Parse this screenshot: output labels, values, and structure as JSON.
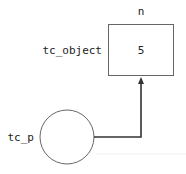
{
  "object": {
    "name_label": "n",
    "var_label": "tc_object",
    "value": "5"
  },
  "pointer": {
    "var_label": "tc_p"
  },
  "colors": {
    "stroke": "#555555",
    "arrow": "#333333"
  }
}
